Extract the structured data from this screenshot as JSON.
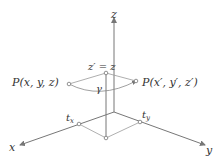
{
  "diagram": {
    "type": "3d-coordinate-rotation",
    "axes": {
      "x_label": "x",
      "y_label": "y",
      "z_label": "z"
    },
    "points": {
      "p_original": "P(x, y, z)",
      "p_rotated": "P(x′, y′, z′)",
      "z_equality": "z′ = z",
      "angle": "γ",
      "t_x": "t",
      "t_x_sub": "x",
      "t_y": "t",
      "t_y_sub": "y"
    },
    "colors": {
      "axis": "#777777",
      "projection": "#b0b0b0",
      "text": "#333333"
    }
  }
}
